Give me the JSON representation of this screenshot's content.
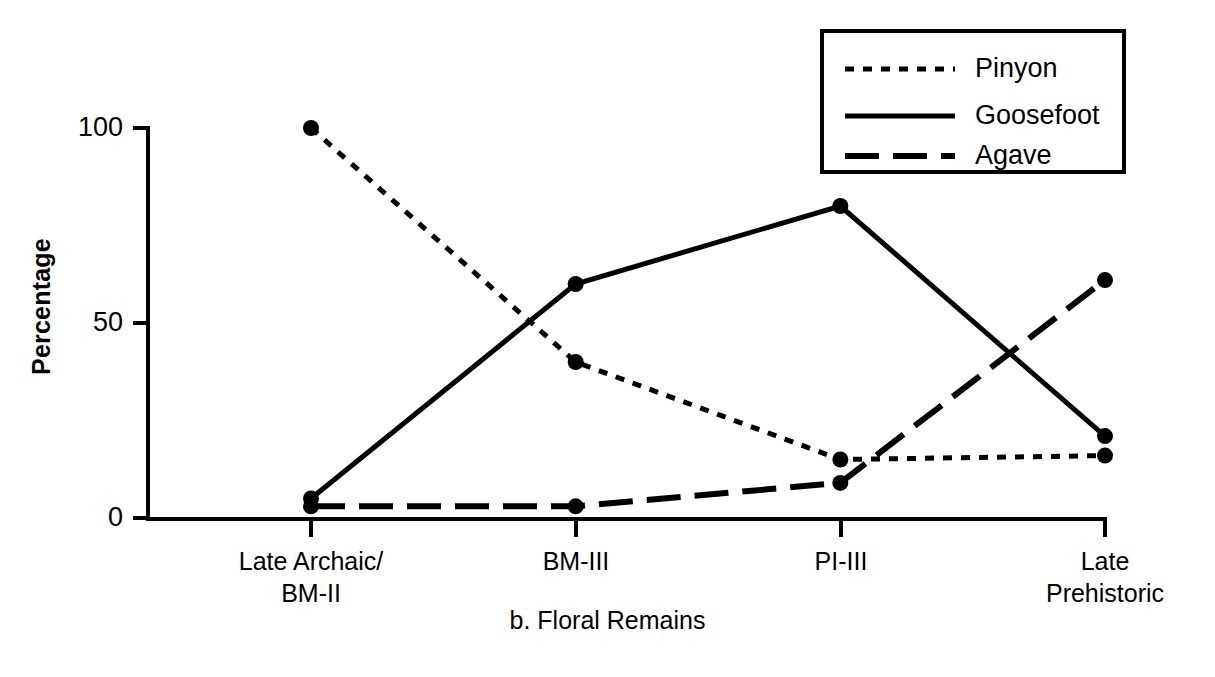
{
  "chart_data": {
    "type": "line",
    "title": "",
    "caption": "b. Floral Remains",
    "xlabel": "",
    "ylabel": "Percentage",
    "categories": [
      "Late Archaic/\nBM-II",
      "BM-III",
      "PI-III",
      "Late\nPrehistoric"
    ],
    "category_labels_flat": [
      "Late Archaic/ BM-II",
      "BM-III",
      "PI-III",
      "Late Prehistoric"
    ],
    "ylim": [
      0,
      100
    ],
    "yticks": [
      0,
      50,
      100
    ],
    "ytick_labels": [
      "0",
      "50",
      "100"
    ],
    "grid": false,
    "legend_position": "top-right",
    "series": [
      {
        "name": "Pinyon",
        "style": "dotted",
        "marker": "circle",
        "values": [
          100,
          40,
          15,
          16
        ]
      },
      {
        "name": "Goosefoot",
        "style": "solid",
        "marker": "circle",
        "values": [
          5,
          60,
          80,
          21
        ]
      },
      {
        "name": "Agave",
        "style": "dashed",
        "marker": "circle",
        "values": [
          3,
          3,
          9,
          61
        ]
      }
    ]
  },
  "axis": {
    "ytick_0": "0",
    "ytick_50": "50",
    "ytick_100": "100",
    "ylabel": "Percentage"
  },
  "xcategories": {
    "c0": "Late Archaic/\nBM-II",
    "c1": "BM-III",
    "c2": "PI-III",
    "c3": "Late\nPrehistoric"
  },
  "legend": {
    "items": [
      {
        "label": "Pinyon",
        "style": "dotted"
      },
      {
        "label": "Goosefoot",
        "style": "solid"
      },
      {
        "label": "Agave",
        "style": "dashed"
      }
    ],
    "item0_label": "Pinyon",
    "item1_label": "Goosefoot",
    "item2_label": "Agave"
  },
  "caption": "b. Floral Remains",
  "colors": {
    "ink": "#000000",
    "background": "#ffffff"
  }
}
